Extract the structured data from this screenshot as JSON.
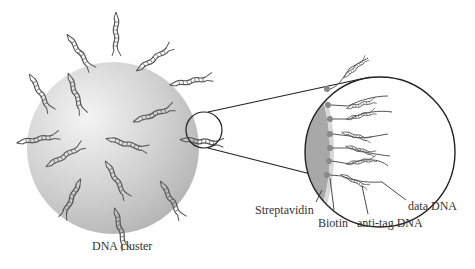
{
  "diagram": {
    "cluster_label": "DNA cluster",
    "inset_labels": {
      "streptavidin": "Streptavidin",
      "biotin": "Biotin",
      "anti_tag": "anti-tag DNA",
      "data_dna": "data DNA"
    },
    "colors": {
      "sphere_light": "#f0f0f0",
      "sphere_dark": "#b8b8b8",
      "inset_surface": "#a8a8a8",
      "strand": "#555555",
      "biotin_dot": "#888888"
    }
  }
}
